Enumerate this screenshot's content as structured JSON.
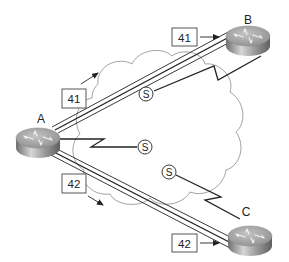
{
  "diagram": {
    "type": "network-topology",
    "cloud": {
      "name": "frame-relay-cloud"
    },
    "routers": [
      {
        "id": "A",
        "label": "A"
      },
      {
        "id": "B",
        "label": "B"
      },
      {
        "id": "C",
        "label": "C"
      }
    ],
    "pvc_links": [
      {
        "from": "A",
        "to": "B",
        "dlci_near_A": "41",
        "dlci_near_B": "41"
      },
      {
        "from": "A",
        "to": "C",
        "dlci_near_A": "42",
        "dlci_near_C": "42"
      }
    ],
    "serial_links": [
      {
        "router": "A",
        "symbol": "S"
      },
      {
        "router": "B",
        "symbol": "S"
      },
      {
        "router": "C",
        "symbol": "S"
      }
    ]
  },
  "labels": {
    "router_a": "A",
    "router_b": "B",
    "router_c": "C",
    "dlci_ab_left": "41",
    "dlci_ab_right": "41",
    "dlci_ac_left": "42",
    "dlci_ac_right": "42",
    "serial_a": "S",
    "serial_b": "S",
    "serial_c": "S"
  },
  "colors": {
    "line": "#222222",
    "cloud": "#8a8a8a",
    "router_top": "#a9a9a9",
    "router_side": "#7d7d7d"
  }
}
